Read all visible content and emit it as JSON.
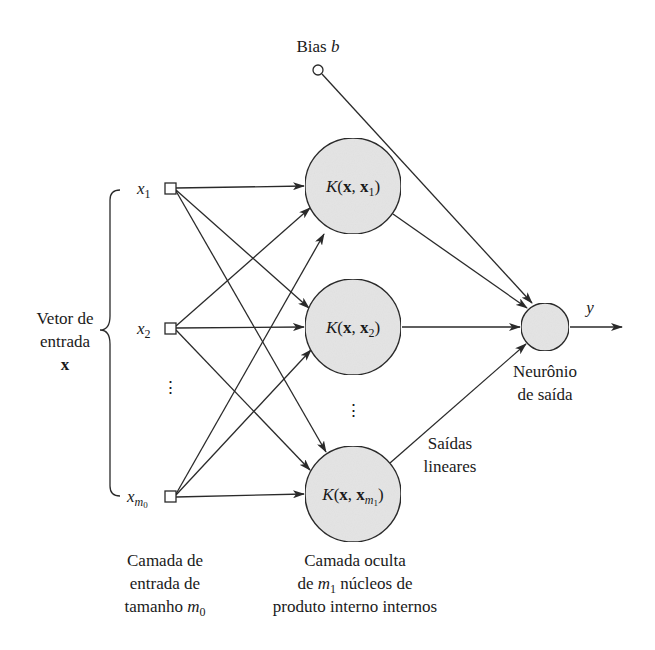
{
  "diagram": {
    "type": "rbf-kernel-network",
    "bias": {
      "label_text": "Bias ",
      "label_var": "b"
    },
    "input_vector": {
      "line1": "Vetor de",
      "line2": "entrada",
      "symbol": "x"
    },
    "inputs": [
      {
        "var": "x",
        "sub": "1"
      },
      {
        "var": "x",
        "sub": "2"
      },
      {
        "var": "x",
        "sub": "m",
        "subsub": "0"
      }
    ],
    "input_ellipsis": "⋮",
    "hidden": [
      {
        "k": "K",
        "open": "(",
        "x": "x",
        "comma": ", ",
        "xi": "x",
        "sub": "1",
        "close": ")"
      },
      {
        "k": "K",
        "open": "(",
        "x": "x",
        "comma": ", ",
        "xi": "x",
        "sub": "2",
        "close": ")"
      },
      {
        "k": "K",
        "open": "(",
        "x": "x",
        "comma": ", ",
        "xi": "x",
        "sub": "m",
        "subsub": "1",
        "close": ")"
      }
    ],
    "hidden_ellipsis": "⋮",
    "output": {
      "var": "y",
      "line1": "Neurônio",
      "line2": "de saída"
    },
    "linear_outputs": {
      "line1": "Saídas",
      "line2": "lineares"
    },
    "input_layer_caption": {
      "line1": "Camada de",
      "line2": "entrada de",
      "line3_text": "tamanho ",
      "line3_var": "m",
      "line3_sub": "0"
    },
    "hidden_layer_caption": {
      "line1": "Camada oculta",
      "line2_pre": "de ",
      "line2_var": "m",
      "line2_sub": "1",
      "line2_post": " núcleos de",
      "line3": "produto interno internos"
    },
    "colors": {
      "node_fill": "#e4e4e4",
      "stroke": "#2a2a2a",
      "text": "#1a1a1a",
      "background": "#ffffff"
    }
  }
}
